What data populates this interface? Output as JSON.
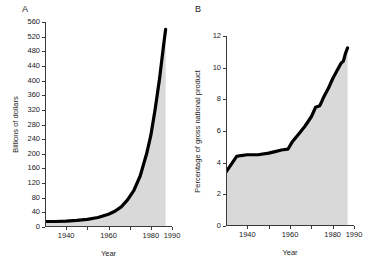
{
  "figure": {
    "background": "#ffffff",
    "line_color": "#000000",
    "fill_color": "#d9d9d9",
    "axis_color": "#3a3a3a"
  },
  "panels": [
    {
      "letter": "A"
    },
    {
      "letter": "B"
    }
  ],
  "chart_data": [
    {
      "type": "area",
      "panel": "A",
      "title": "",
      "xlabel": "Year",
      "ylabel": "Billions of dollars",
      "xlim": [
        1930,
        1990
      ],
      "ylim": [
        0,
        560
      ],
      "grid": false,
      "legend": "none",
      "yticks": [
        0,
        40,
        80,
        120,
        160,
        200,
        240,
        280,
        320,
        360,
        400,
        440,
        480,
        520,
        560
      ],
      "ytick_labels": [
        "0",
        "40",
        "80",
        "120",
        "160",
        "200",
        "240",
        "280",
        "320",
        "360",
        "400",
        "440",
        "480",
        "520",
        "560"
      ],
      "xticks": [
        1940,
        1950,
        1960,
        1970,
        1980,
        1990
      ],
      "xtick_labels": [
        "1940",
        "",
        "1960",
        "",
        "1980",
        "1990"
      ],
      "x": [
        1930,
        1935,
        1940,
        1945,
        1950,
        1955,
        1960,
        1963,
        1966,
        1969,
        1972,
        1975,
        1978,
        1980,
        1982,
        1984,
        1986,
        1987
      ],
      "values": [
        15,
        15,
        16,
        18,
        21,
        26,
        35,
        43,
        55,
        74,
        100,
        140,
        200,
        250,
        320,
        400,
        495,
        540
      ]
    },
    {
      "type": "area",
      "panel": "B",
      "title": "",
      "xlabel": "Year",
      "ylabel": "Percentage of gross national product",
      "xlim": [
        1930,
        1990
      ],
      "ylim": [
        0,
        12
      ],
      "grid": false,
      "legend": "none",
      "yticks": [
        0,
        2,
        4,
        6,
        8,
        10,
        12
      ],
      "ytick_labels": [
        "0",
        "2",
        "4",
        "6",
        "8",
        "10",
        "12"
      ],
      "xticks": [
        1940,
        1950,
        1960,
        1970,
        1980,
        1990
      ],
      "xtick_labels": [
        "1940",
        "",
        "1960",
        "",
        "1980",
        "1990"
      ],
      "x": [
        1930,
        1933,
        1935,
        1937,
        1940,
        1945,
        1950,
        1953,
        1956,
        1959,
        1961,
        1964,
        1967,
        1970,
        1972,
        1974,
        1976,
        1978,
        1980,
        1982,
        1984,
        1985,
        1986,
        1987
      ],
      "values": [
        3.4,
        4.0,
        4.4,
        4.45,
        4.5,
        4.5,
        4.6,
        4.7,
        4.8,
        4.85,
        5.3,
        5.8,
        6.3,
        6.9,
        7.5,
        7.6,
        8.2,
        8.7,
        9.3,
        9.8,
        10.3,
        10.4,
        10.9,
        11.25
      ]
    }
  ]
}
